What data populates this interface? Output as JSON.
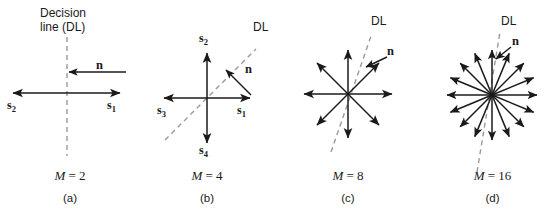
{
  "figure": {
    "title_note": "Decision line geometry for M-ary signal constellations",
    "background_color": "#ffffff",
    "stroke_color": "#1a1a1a",
    "dashed_color": "#9a9a9a"
  },
  "panels": [
    {
      "id": "a",
      "caption_m": "M",
      "caption_eq": " = ",
      "caption_value": "2",
      "caption_letter": "(a)",
      "header_line1": "Decision",
      "header_line2": "line (DL)",
      "decision_line_label": "",
      "noise_label": "n",
      "signal_labels": [
        "s",
        "s"
      ],
      "signal_subscripts": [
        "2",
        "1"
      ],
      "signal_count": 2,
      "angles_deg": [
        0,
        180
      ]
    },
    {
      "id": "b",
      "caption_m": "M",
      "caption_eq": " = ",
      "caption_value": "4",
      "caption_letter": "(b)",
      "decision_line_label": "DL",
      "noise_label": "n",
      "signal_labels": [
        "s",
        "s",
        "s",
        "s"
      ],
      "signal_subscripts": [
        "1",
        "2",
        "3",
        "4"
      ],
      "signal_count": 4,
      "angles_deg": [
        0,
        90,
        180,
        270
      ]
    },
    {
      "id": "c",
      "caption_m": "M",
      "caption_eq": " = ",
      "caption_value": "8",
      "caption_letter": "(c)",
      "decision_line_label": "DL",
      "noise_label": "n",
      "signal_labels": [],
      "signal_subscripts": [],
      "signal_count": 8,
      "angles_deg": [
        0,
        45,
        90,
        135,
        180,
        225,
        270,
        315
      ]
    },
    {
      "id": "d",
      "caption_m": "M",
      "caption_eq": " = ",
      "caption_value": "16",
      "caption_letter": "(d)",
      "decision_line_label": "DL",
      "noise_label": "n",
      "signal_labels": [],
      "signal_subscripts": [],
      "signal_count": 16,
      "angles_deg": [
        0,
        22.5,
        45,
        67.5,
        90,
        112.5,
        135,
        157.5,
        180,
        202.5,
        225,
        247.5,
        270,
        292.5,
        315,
        337.5
      ]
    }
  ]
}
